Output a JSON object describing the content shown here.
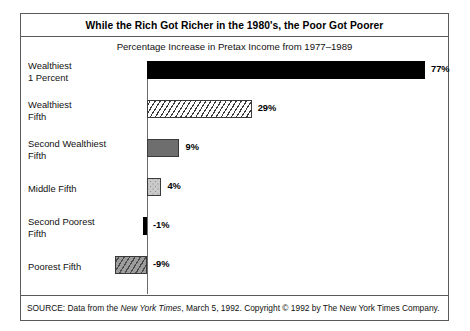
{
  "figure": {
    "title": "While the Rich Got Richer in the 1980's, the Poor Got Poorer",
    "subtitle": "Percentage Increase in Pretax Income from 1977–1989",
    "source_prefix": "SOURCE: Data from the ",
    "source_italic": "New York Times",
    "source_suffix": ", March 5, 1992. Copyright © 1992 by The New York Times Company.",
    "colors": {
      "frame": "#5a5a5a",
      "axis": "#6b6b6b",
      "bar_black": "#000000",
      "bar_dark_gray": "#6e6e6e",
      "bar_light_gray": "#c9c9c9",
      "bar_hatch_gray": "#9d9d9d",
      "bar_white": "#ffffff",
      "text": "#111111"
    }
  },
  "chart_data": {
    "type": "bar",
    "orientation": "horizontal",
    "title": "While the Rich Got Richer in the 1980's, the Poor Got Poorer",
    "subtitle": "Percentage Increase in Pretax Income from 1977–1989",
    "xlabel": "",
    "ylabel": "",
    "xlim": [
      -9,
      77
    ],
    "grid": false,
    "legend": "none",
    "zero_axis": true,
    "units": "percent",
    "categories": [
      "Wealthiest 1 Percent",
      "Wealthiest Fifth",
      "Second Wealthiest Fifth",
      "Middle Fifth",
      "Second Poorest Fifth",
      "Poorest Fifth"
    ],
    "values": [
      77,
      29,
      9,
      4,
      -1,
      -9
    ],
    "data_labels": [
      "77%",
      "29%",
      "9%",
      "4%",
      "-1%",
      "-9%"
    ],
    "bars": [
      {
        "label_line1": "Wealthiest",
        "label_line2": "1 Percent",
        "value": 77,
        "data_label": "77%",
        "fill": "solid-black",
        "fill_class": "fill-black"
      },
      {
        "label_line1": "Wealthiest",
        "label_line2": "Fifth",
        "value": 29,
        "data_label": "29%",
        "fill": "diagonal-hatch-white",
        "fill_class": "fill-hatch-white"
      },
      {
        "label_line1": "Second Wealthiest",
        "label_line2": "Fifth",
        "value": 9,
        "data_label": "9%",
        "fill": "solid-dark-gray",
        "fill_class": "fill-dark-gray"
      },
      {
        "label_line1": "Middle Fifth",
        "label_line2": "",
        "value": 4,
        "data_label": "4%",
        "fill": "stipple-light-gray",
        "fill_class": "fill-stipple"
      },
      {
        "label_line1": "Second Poorest",
        "label_line2": "Fifth",
        "value": -1,
        "data_label": "-1%",
        "fill": "solid-black",
        "fill_class": "fill-black"
      },
      {
        "label_line1": "Poorest Fifth",
        "label_line2": "",
        "value": -9,
        "data_label": "-9%",
        "fill": "diagonal-hatch-gray",
        "fill_class": "fill-hatch-gray"
      }
    ]
  }
}
